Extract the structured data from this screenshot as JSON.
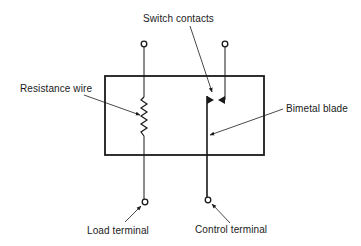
{
  "diagram": {
    "labels": {
      "switch_contacts": "Switch contacts",
      "resistance_wire": "Resistance wire",
      "bimetal_blade": "Bimetal blade",
      "load_terminal": "Load terminal",
      "control_terminal": "Control terminal"
    },
    "colors": {
      "line": "#1a1a1a",
      "background": "#ffffff"
    },
    "components": [
      {
        "id": "housing",
        "type": "rectangle"
      },
      {
        "id": "resistance-wire",
        "type": "resistor-zigzag"
      },
      {
        "id": "switch-contacts",
        "type": "contact-pair"
      },
      {
        "id": "bimetal-blade",
        "type": "vertical-blade"
      },
      {
        "id": "top-left-terminal",
        "type": "terminal"
      },
      {
        "id": "top-right-terminal",
        "type": "terminal"
      },
      {
        "id": "load-terminal",
        "type": "terminal"
      },
      {
        "id": "control-terminal",
        "type": "terminal"
      }
    ]
  }
}
